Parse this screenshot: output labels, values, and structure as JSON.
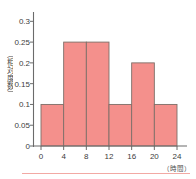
{
  "chart_data": {
    "type": "bar",
    "title": "",
    "subtitle": "",
    "xlabel": "（時間）",
    "ylabel": "（相対度数）",
    "categories": [
      "0-4",
      "4-8",
      "8-12",
      "12-16",
      "16-20",
      "20-24"
    ],
    "bin_edges": [
      0,
      4,
      8,
      12,
      16,
      20,
      24
    ],
    "values": [
      0.1,
      0.25,
      0.25,
      0.1,
      0.2,
      0.1
    ],
    "x_tick_labels": [
      "0",
      "4",
      "8",
      "12",
      "16",
      "20",
      "24"
    ],
    "x_tick_values": [
      0,
      4,
      8,
      12,
      16,
      20,
      24
    ],
    "y_tick_labels": [
      "0",
      "0.05",
      "0.1",
      "0.15",
      "0.2",
      "0.25",
      "0.3"
    ],
    "y_tick_values": [
      0,
      0.05,
      0.1,
      0.15,
      0.2,
      0.25,
      0.3
    ],
    "xlim": [
      0,
      24
    ],
    "ylim": [
      0,
      0.32
    ],
    "grid": false,
    "legend": null,
    "bar_fill_color": "#F4908C",
    "bar_edge_color": "#7d6f68",
    "axis_color": "#6b6b6b",
    "text_color": "#3d3d3d",
    "background_color": "#ffffff",
    "footer_rule_color": "#f2a9a4"
  }
}
